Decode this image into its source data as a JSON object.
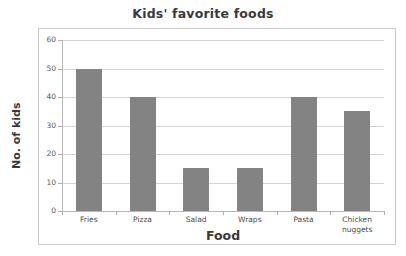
{
  "chart_data": {
    "type": "bar",
    "title": "Kids' favorite foods",
    "xlabel": "Food",
    "ylabel": "No. of kids",
    "categories": [
      "Fries",
      "Pizza",
      "Salad",
      "Wraps",
      "Pasta",
      "Chicken nuggets"
    ],
    "category_lines": [
      [
        "Fries"
      ],
      [
        "Pizza"
      ],
      [
        "Salad"
      ],
      [
        "Wraps"
      ],
      [
        "Pasta"
      ],
      [
        "Chicken",
        "nuggets"
      ]
    ],
    "values": [
      50,
      40,
      15,
      15,
      40,
      35
    ],
    "ylim": [
      0,
      60
    ],
    "ytick_labels": [
      "60",
      "50",
      "40",
      "30",
      "20",
      "10",
      "0"
    ],
    "ytick_values": [
      60,
      50,
      40,
      30,
      20,
      10,
      0
    ],
    "grid": true,
    "grid_axis": "y",
    "legend": false,
    "bar_color": "#838383",
    "grid_color": "#d5d5d5",
    "axis_color": "#b8b8b8",
    "text_color": "#3a3a3a",
    "background": "#ffffff"
  }
}
